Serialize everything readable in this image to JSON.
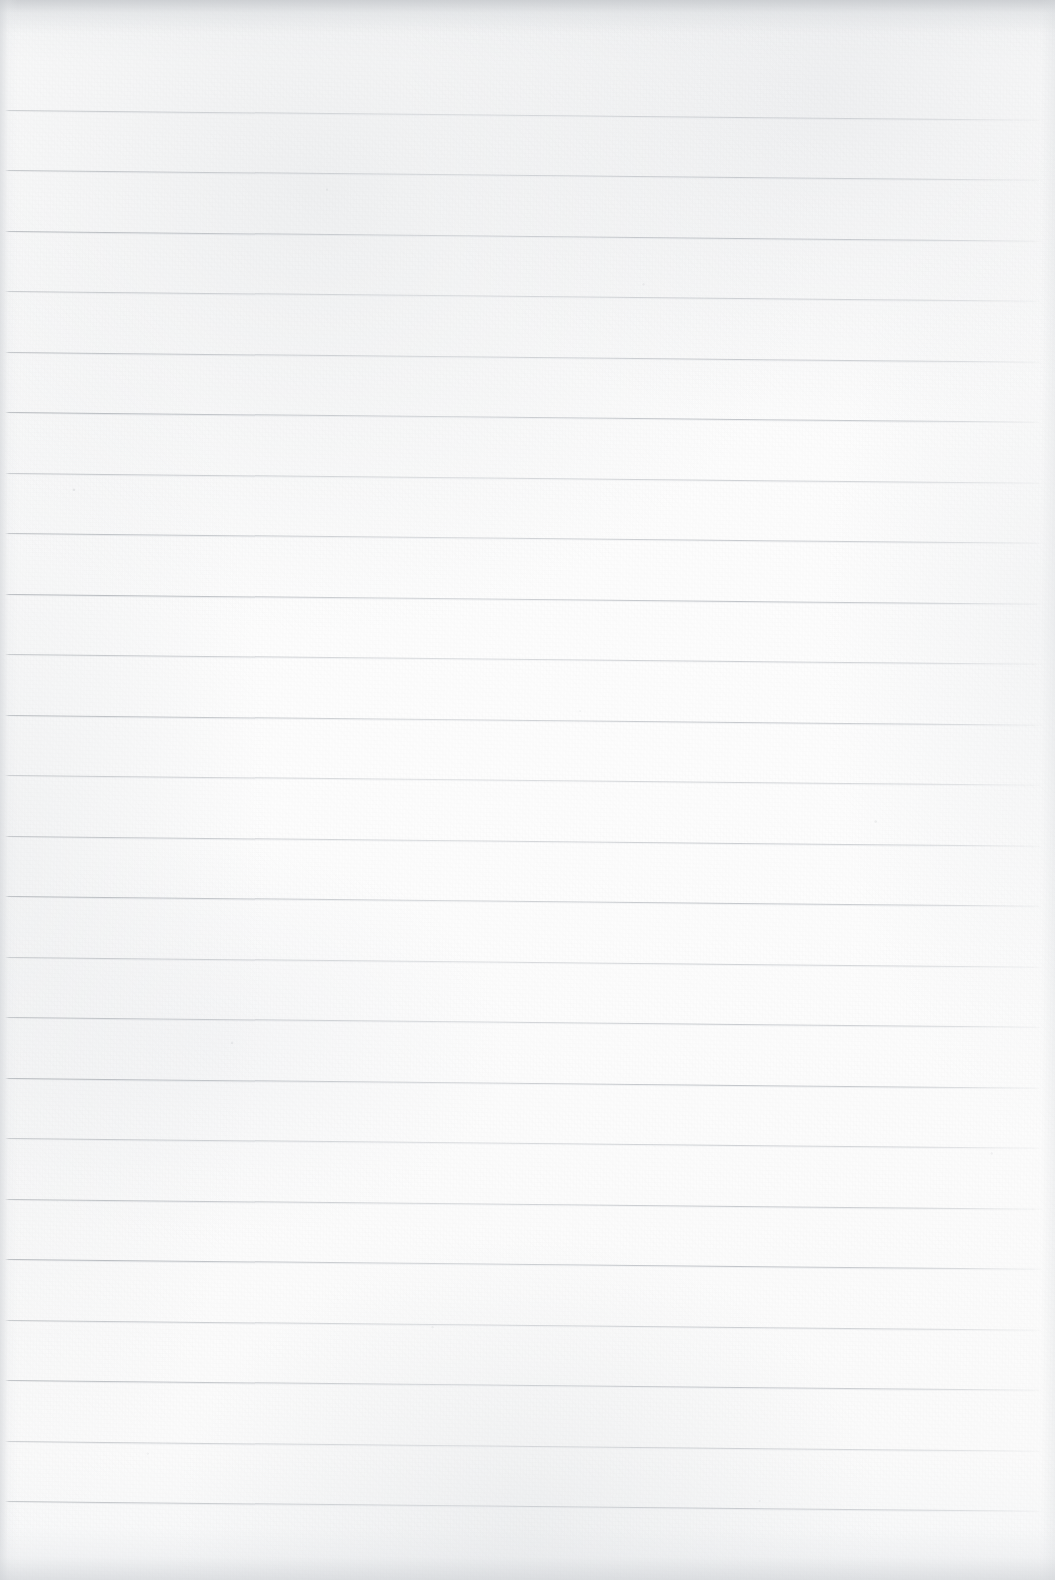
{
  "document": {
    "kind": "scanned-lined-notebook-page",
    "title": "Blank Ruled Notebook Page",
    "content_text": "",
    "handwriting": "",
    "printed_text": "",
    "page_number": "",
    "header_text": "",
    "footer_text": ""
  },
  "canvas": {
    "width": 1055,
    "height": 1580
  },
  "paper": {
    "background_color": "#fbfbfb",
    "highlight_color": "#fdfdfd",
    "shadow_color": "#f4f5f6",
    "texture": "fibrous-scan-grain",
    "margin_rule_present": "false",
    "hole_punches": "0"
  },
  "ruling": {
    "line_color": "#b0b4b9",
    "line_color_faint": "#ced2d7",
    "line_count": 24,
    "first_line_y": 110,
    "line_spacing": 60.5,
    "line_thickness": 1,
    "line_start_x": 5,
    "line_end_x": 1043,
    "skew_drop_px": 10,
    "skew_degrees": 0.54,
    "lines_y": [
      110,
      170,
      231,
      291,
      352,
      412,
      473,
      533,
      594,
      654,
      715,
      775,
      836,
      896,
      957,
      1017,
      1078,
      1138,
      1199,
      1259,
      1320,
      1380,
      1441,
      1501
    ]
  },
  "edges": {
    "top_shadow_color": "#c4c7cb",
    "left_shadow_color": "#cdd0d4",
    "right_shadow_color": "#d6d9dc",
    "bottom_shadow_color": "#ced1d5",
    "top_shadow_height": 34,
    "bottom_shadow_height": 52,
    "left_shadow_width": 18,
    "right_shadow_width": 14
  }
}
